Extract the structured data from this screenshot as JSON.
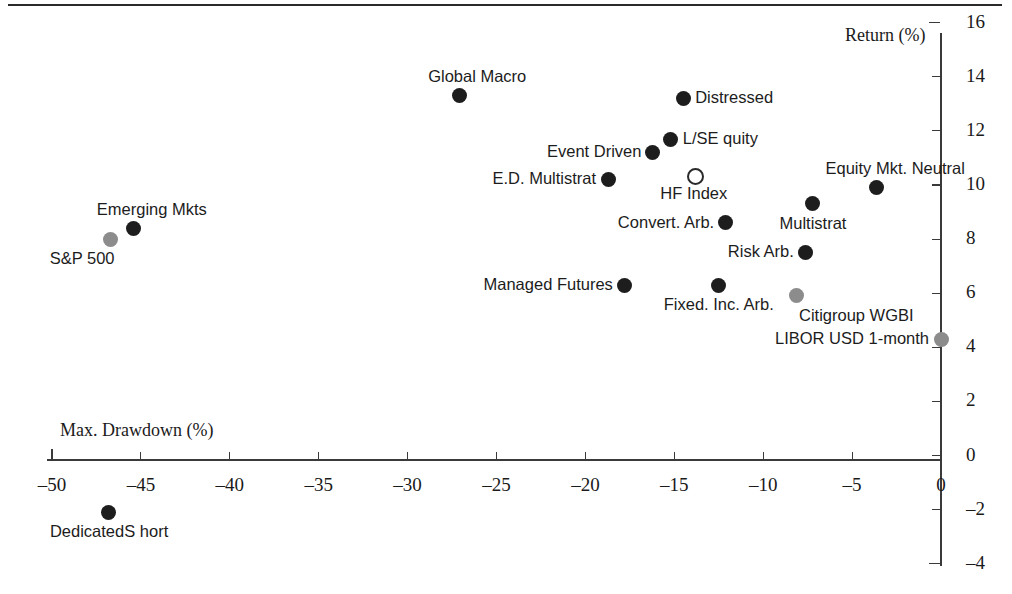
{
  "chart_data": {
    "type": "scatter",
    "title": "",
    "xlabel": "Max. Drawdown (%)",
    "ylabel": "Return (%)",
    "xlim": [
      -52,
      0
    ],
    "ylim": [
      -4,
      16
    ],
    "xticks": [
      -50,
      -45,
      -40,
      -35,
      -30,
      -25,
      -20,
      -15,
      -10,
      -5,
      0
    ],
    "xtick_labels": [
      "–50",
      "–45",
      "–40",
      "–35",
      "–30",
      "–25",
      "–20",
      "–15",
      "–10",
      "–5",
      "0"
    ],
    "yticks": [
      16,
      14,
      12,
      10,
      8,
      6,
      4,
      2,
      0,
      -2,
      -4
    ],
    "ytick_labels": [
      "16",
      "14",
      "12",
      "10",
      "8",
      "6",
      "4",
      "2",
      "0",
      "–2",
      "–4"
    ],
    "grid": false,
    "legend": "none",
    "marker_styles": {
      "hedge_fund": "filled-dark",
      "benchmark": "filled-gray",
      "index": "hollow"
    },
    "colors": {
      "hedge_fund": "#1d1d1d",
      "benchmark": "#8c8c8c",
      "index_outline": "#2a2a2a",
      "axis": "#3a3a3a",
      "text": "#1c1c1c"
    },
    "points": [
      {
        "name": "Global Macro",
        "label": "Global Macro",
        "x": -27.1,
        "y": 13.3,
        "style": "filled-dark",
        "label_pos": "above"
      },
      {
        "name": "Distressed",
        "label": "Distressed",
        "x": -14.5,
        "y": 13.2,
        "style": "filled-dark",
        "label_pos": "right"
      },
      {
        "name": "L/S Equity",
        "label": "L/SE quity",
        "x": -15.2,
        "y": 11.7,
        "style": "filled-dark",
        "label_pos": "right"
      },
      {
        "name": "Event Driven",
        "label": "Event Driven",
        "x": -16.2,
        "y": 11.2,
        "style": "filled-dark",
        "label_pos": "left"
      },
      {
        "name": "E.D. Multistrat",
        "label": "E.D. Multistrat",
        "x": -18.7,
        "y": 10.2,
        "style": "filled-dark",
        "label_pos": "left"
      },
      {
        "name": "HF Index",
        "label": "HF Index",
        "x": -13.9,
        "y": 10.4,
        "style": "hollow",
        "label_pos": "below"
      },
      {
        "name": "Equity Mkt. Neutral",
        "label": "Equity Mkt. Neutral",
        "x": -3.6,
        "y": 9.9,
        "style": "filled-dark",
        "label_pos": "above"
      },
      {
        "name": "Multistrat",
        "label": "Multistrat",
        "x": -7.2,
        "y": 9.3,
        "style": "filled-dark",
        "label_pos": "below"
      },
      {
        "name": "Convert. Arb.",
        "label": "Convert. Arb.",
        "x": -12.1,
        "y": 8.6,
        "style": "filled-dark",
        "label_pos": "left"
      },
      {
        "name": "Risk Arb.",
        "label": "Risk Arb.",
        "x": -7.6,
        "y": 7.5,
        "style": "filled-dark",
        "label_pos": "left"
      },
      {
        "name": "Managed Futures",
        "label": "Managed Futures",
        "x": -17.8,
        "y": 6.3,
        "style": "filled-dark",
        "label_pos": "left"
      },
      {
        "name": "Fixed. Inc. Arb.",
        "label": "Fixed. Inc. Arb.",
        "x": -12.5,
        "y": 6.3,
        "style": "filled-dark",
        "label_pos": "below"
      },
      {
        "name": "Citigroup WGBI",
        "label": "Citigroup WGBI",
        "x": -8.1,
        "y": 5.9,
        "style": "filled-gray",
        "label_pos": "below-right"
      },
      {
        "name": "LIBOR USD 1-month",
        "label": "LIBOR USD 1-month",
        "x": 0.0,
        "y": 4.3,
        "style": "filled-gray",
        "label_pos": "left"
      },
      {
        "name": "Emerging Mkts",
        "label": "Emerging Mkts",
        "x": -45.4,
        "y": 8.4,
        "style": "filled-dark",
        "label_pos": "above"
      },
      {
        "name": "S&P 500",
        "label": "S&P 500",
        "x": -46.7,
        "y": 8.0,
        "style": "filled-gray",
        "label_pos": "below-left"
      },
      {
        "name": "Dedicated Short",
        "label": "DedicatedS hort",
        "x": -46.8,
        "y": -2.1,
        "style": "filled-dark",
        "label_pos": "below"
      }
    ]
  },
  "labels": {
    "global_macro": "Global Macro",
    "distressed": "Distressed",
    "ls_equity": "L/SE quity",
    "event_driven": "Event Driven",
    "ed_multistrat": "E.D. Multistrat",
    "hf_index": "HF Index",
    "equity_mkt_neutral": "Equity Mkt. Neutral",
    "multistrat": "Multistrat",
    "convert_arb": "Convert. Arb.",
    "risk_arb": "Risk Arb.",
    "managed_futures": "Managed Futures",
    "fixed_inc_arb": "Fixed. Inc. Arb.",
    "citigroup_wgbi": "Citigroup WGBI",
    "libor_usd_1month": "LIBOR USD 1-month",
    "emerging_mkts": "Emerging Mkts",
    "sp500": "S&P 500",
    "dedicated_short": "DedicatedS hort"
  }
}
